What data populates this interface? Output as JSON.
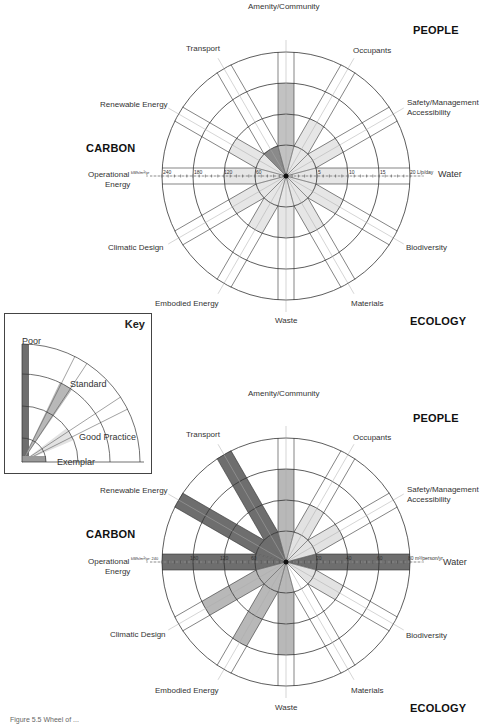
{
  "groups": {
    "people": "PEOPLE",
    "carbon": "CARBON",
    "ecology": "ECOLOGY"
  },
  "key": {
    "title": "Key",
    "levels": [
      "Poor",
      "Standard",
      "Good Practice",
      "Exemplar"
    ],
    "colors": {
      "poor": "#6b6b6b",
      "standard": "#b5b5b5",
      "good_practice": "#dedede",
      "exemplar": "#9a9a9a"
    }
  },
  "chart_data": [
    {
      "type": "radial",
      "title": "Sustainability wheel – baseline",
      "rings": 4,
      "ring_levels": [
        "Exemplar",
        "Good Practice",
        "Standard",
        "Poor"
      ],
      "categories": [
        "Amenity/Community",
        "Occupants",
        "Safety/Management Accessibility",
        "Water",
        "Biodiversity",
        "Materials",
        "Waste",
        "Embodied Energy",
        "Climatic Design",
        "Operational Energy",
        "Renewable Energy",
        "Transport"
      ],
      "values": [
        3,
        2,
        2,
        2,
        2,
        2,
        2,
        2,
        2,
        2,
        2,
        1
      ],
      "highlight": {
        "category": "Transport",
        "level": 1,
        "shade": "dark"
      },
      "operational_energy_axis": {
        "unit": "kWh/m²/yr",
        "ticks": [
          240,
          180,
          120,
          60
        ]
      },
      "water_axis": {
        "unit": "L/p/day",
        "ticks": [
          5,
          10,
          15,
          20
        ]
      }
    },
    {
      "type": "radial",
      "title": "Sustainability wheel – assessed",
      "rings": 4,
      "ring_levels": [
        "Exemplar",
        "Good Practice",
        "Standard",
        "Poor"
      ],
      "categories": [
        "Amenity/Community",
        "Occupants",
        "Safety/Management Accessibility",
        "Water",
        "Biodiversity",
        "Materials",
        "Waste",
        "Embodied Energy",
        "Climatic Design",
        "Operational Energy",
        "Renewable Energy",
        "Transport"
      ],
      "values": [
        3,
        2,
        2,
        4,
        2,
        1,
        3,
        3,
        3,
        4,
        4,
        4
      ],
      "shades": [
        "standard",
        "good",
        "good",
        "poor",
        "good",
        "none",
        "standard",
        "standard",
        "standard",
        "poor",
        "poor",
        "poor"
      ],
      "operational_energy_axis": {
        "unit": "kWh/m²/yr",
        "ticks": [
          240,
          180,
          120,
          60
        ]
      },
      "water_axis": {
        "unit": "m³/person/yr",
        "ticks": [
          20,
          40,
          60,
          80
        ]
      }
    }
  ],
  "charts": [
    {
      "labels": {
        "amenity": "Amenity/Community",
        "transport": "Transport",
        "occupants": "Occupants",
        "renewable": "Renewable Energy",
        "safety1": "Safety/Management",
        "safety2": "Accessibility",
        "operational1": "Operational",
        "operational2": "Energy",
        "water": "Water",
        "climatic": "Climatic Design",
        "biodiversity": "Biodiversity",
        "embodied": "Embodied Energy",
        "materials": "Materials",
        "waste": "Waste"
      },
      "oe_unit": "kWh/m²/yr",
      "oe_ticks": [
        "240",
        "180",
        "120",
        "60"
      ],
      "w_unit": "20 L/p/day",
      "w_ticks": [
        "5",
        "10",
        "15"
      ]
    },
    {
      "labels": {
        "amenity": "Amenity/Community",
        "transport": "Transport",
        "occupants": "Occupants",
        "renewable": "Renewable Energy",
        "safety1": "Safety/Management",
        "safety2": "Accessibility",
        "operational1": "Operational",
        "operational2": "Energy",
        "water": "Water",
        "climatic": "Climatic Design",
        "biodiversity": "Biodiversity",
        "embodied": "Embodied Energy",
        "materials": "Materials",
        "waste": "Waste"
      },
      "oe_unit": "kWh/m²/yr: 240",
      "oe_ticks": [
        "180",
        "120",
        "60"
      ],
      "w_unit": "80 m³/person/yr",
      "w_ticks": [
        "20",
        "40",
        "60"
      ]
    }
  ],
  "caption": "Figure 5.5 Wheel of ..."
}
